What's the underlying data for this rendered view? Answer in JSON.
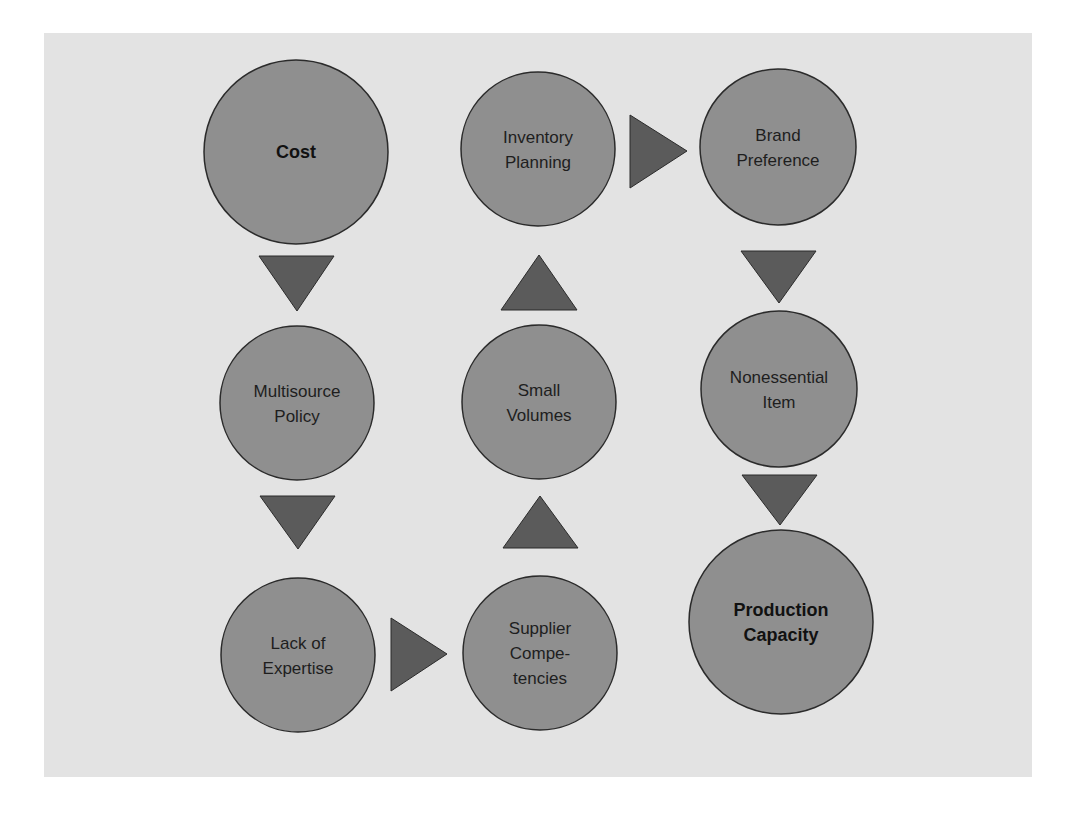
{
  "diagram": {
    "type": "flow-diagram",
    "colors": {
      "background": "#ffffff",
      "panel": "#e3e3e3",
      "node_fill": "#8f8f8f",
      "node_stroke": "#2b2b2b",
      "arrow_fill": "#5b5b5b",
      "text": "#1e1e1e"
    },
    "nodes": [
      {
        "id": "cost",
        "lines": [
          "Cost"
        ],
        "bold": true,
        "cx": 296,
        "cy": 152,
        "r": 92
      },
      {
        "id": "multisource-policy",
        "lines": [
          "Multisource",
          "Policy"
        ],
        "bold": false,
        "cx": 297,
        "cy": 403,
        "r": 77
      },
      {
        "id": "lack-of-expertise",
        "lines": [
          "Lack of",
          "Expertise"
        ],
        "bold": false,
        "cx": 298,
        "cy": 655,
        "r": 77
      },
      {
        "id": "supplier-competencies",
        "lines": [
          "Supplier",
          "Compe-",
          "tencies"
        ],
        "bold": false,
        "cx": 540,
        "cy": 653,
        "r": 77
      },
      {
        "id": "small-volumes",
        "lines": [
          "Small",
          "Volumes"
        ],
        "bold": false,
        "cx": 539,
        "cy": 402,
        "r": 77
      },
      {
        "id": "inventory-planning",
        "lines": [
          "Inventory",
          "Planning"
        ],
        "bold": false,
        "cx": 538,
        "cy": 149,
        "r": 77
      },
      {
        "id": "brand-preference",
        "lines": [
          "Brand",
          "Preference"
        ],
        "bold": false,
        "cx": 778,
        "cy": 147,
        "r": 78
      },
      {
        "id": "nonessential-item",
        "lines": [
          "Nonessential",
          "Item"
        ],
        "bold": false,
        "cx": 779,
        "cy": 389,
        "r": 78
      },
      {
        "id": "production-capacity",
        "lines": [
          "Production",
          "Capacity"
        ],
        "bold": true,
        "cx": 781,
        "cy": 622,
        "r": 92
      }
    ],
    "arrows": [
      {
        "from": "cost",
        "to": "multisource-policy",
        "direction": "down",
        "points": "259,256 334,256 297,311"
      },
      {
        "from": "multisource-policy",
        "to": "lack-of-expertise",
        "direction": "down",
        "points": "260,496 335,496 298,549"
      },
      {
        "from": "lack-of-expertise",
        "to": "supplier-competencies",
        "direction": "right",
        "points": "391,618 447,654 391,691"
      },
      {
        "from": "supplier-competencies",
        "to": "small-volumes",
        "direction": "up",
        "points": "503,548 578,548 540,496"
      },
      {
        "from": "small-volumes",
        "to": "inventory-planning",
        "direction": "up",
        "points": "501,310 577,310 539,255"
      },
      {
        "from": "inventory-planning",
        "to": "brand-preference",
        "direction": "right",
        "points": "630,115 687,151 630,188"
      },
      {
        "from": "brand-preference",
        "to": "nonessential-item",
        "direction": "down",
        "points": "741,251 816,251 779,303"
      },
      {
        "from": "nonessential-item",
        "to": "production-capacity",
        "direction": "down",
        "points": "742,475 817,475 780,525"
      }
    ]
  }
}
